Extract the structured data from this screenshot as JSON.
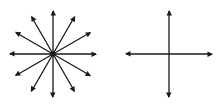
{
  "diagram": {
    "stroke_color": "#1a1a1a",
    "background": "#ffffff",
    "figures": [
      {
        "name": "starburst",
        "rays": 12,
        "center": [
          53,
          54
        ],
        "radius": 43,
        "angles_deg": [
          0,
          30,
          60,
          90,
          120,
          150,
          180,
          210,
          240,
          270,
          300,
          330
        ]
      },
      {
        "name": "cross-axes",
        "rays": 4,
        "center": [
          169,
          54
        ],
        "radius": 43,
        "angles_deg": [
          0,
          90,
          180,
          270
        ]
      }
    ]
  }
}
